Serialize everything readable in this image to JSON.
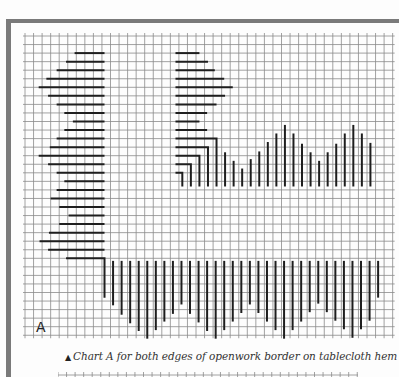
{
  "figure": {
    "label": "A",
    "caption_marker": "▲",
    "caption": "Chart A for both edges of openwork border on tablecloth hem"
  },
  "colors": {
    "frame": "#7a7a7a",
    "grid": "#8a8a8a",
    "stitch": "#1e1e1e",
    "paper": "#fdfdfd"
  },
  "grid": {
    "x0": 25,
    "y0": 36,
    "cell": 8.55,
    "cols": 43,
    "rows": 35
  },
  "chart_data": {
    "type": "diagram",
    "title": "Chart A for both edges of openwork border on tablecloth hem",
    "left_horizontal_bars": {
      "end_col": 9.3,
      "rows": [
        2,
        3,
        4,
        5,
        6,
        7,
        8,
        9,
        10,
        11,
        12,
        13,
        14,
        15,
        16,
        17,
        18,
        19,
        20,
        21,
        22,
        23,
        24,
        25,
        26
      ],
      "start_cols": [
        5.8,
        4.8,
        3.7,
        2.5,
        1.6,
        2.7,
        3.7,
        4.6,
        5.6,
        4.6,
        3.7,
        2.9,
        1.6,
        2.7,
        3.7,
        4.6,
        3.7,
        3.0,
        4.0,
        5.1,
        4.0,
        2.8,
        1.7,
        2.7,
        3.8
      ],
      "note": "last row (26) continues into an L-corner turning down at col 9.3"
    },
    "bottom_corner": {
      "row": 26,
      "start_col": 4.8,
      "corner_col": 9.3,
      "bottom_row": 30.6
    },
    "bottom_vertical_bars": {
      "top_row": 26.3,
      "cols": [
        10.3,
        11.3,
        12.3,
        13.3,
        14.3,
        15.3,
        16.3,
        17.3,
        18.3,
        19.3,
        20.3,
        21.3,
        22.3,
        23.3,
        24.3,
        25.3,
        26.3,
        27.3,
        28.3,
        29.3,
        30.3,
        31.3,
        32.3,
        33.3,
        34.3,
        35.3,
        36.3,
        37.3,
        38.3,
        39.3,
        40.3,
        41.3
      ],
      "bottom_rows": [
        31.5,
        32.6,
        33.6,
        34.5,
        35.4,
        34.4,
        33.4,
        32.5,
        31.4,
        32.5,
        33.5,
        34.5,
        35.4,
        34.4,
        33.4,
        32.4,
        31.4,
        32.4,
        33.4,
        34.4,
        35.4,
        34.4,
        33.4,
        32.3,
        31.3,
        32.3,
        33.3,
        34.3,
        35.3,
        34.3,
        33.3,
        30.6
      ]
    },
    "upper_right_horizontal_bars": {
      "start_col": 17.6,
      "rows": [
        2,
        3,
        4,
        5,
        6,
        7,
        8,
        9,
        10,
        11
      ],
      "end_cols": [
        20.4,
        21.4,
        22.2,
        23.3,
        24.3,
        23.4,
        22.4,
        21.3,
        20.4,
        21.3
      ]
    },
    "upper_right_corners": {
      "start_col": 17.6,
      "rows": [
        12,
        13,
        14,
        15,
        16
      ],
      "corner_cols": [
        22.4,
        21.4,
        20.4,
        19.4,
        18.4
      ],
      "bottom_row": 17.6
    },
    "upper_right_vertical_bars": {
      "bottom_row": 17.6,
      "cols": [
        23.4,
        24.4,
        25.4,
        26.4,
        27.4,
        28.4,
        29.4,
        30.4,
        31.4,
        32.4,
        33.4,
        34.4,
        35.4,
        36.4,
        37.4,
        38.4,
        39.4,
        40.4
      ],
      "top_rows": [
        13.6,
        14.6,
        15.5,
        14.4,
        13.5,
        12.4,
        11.4,
        10.4,
        11.4,
        12.6,
        13.6,
        14.6,
        13.6,
        12.6,
        11.4,
        10.4,
        11.4,
        12.5
      ]
    }
  }
}
